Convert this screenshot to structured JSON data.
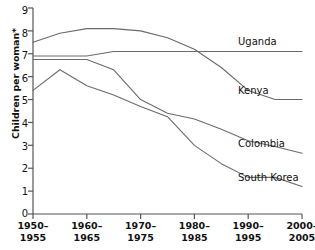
{
  "chart_data": {
    "type": "line",
    "title": "",
    "xlabel": "",
    "ylabel": "Children per woman*",
    "ylim": [
      0,
      9
    ],
    "yticks": [
      0,
      1,
      2,
      3,
      4,
      5,
      6,
      7,
      8,
      9
    ],
    "grid": false,
    "legend_position": "line-end-right",
    "x": [
      "1950-1955",
      "1955-1960",
      "1960-1965",
      "1965-1970",
      "1970-1975",
      "1975-1980",
      "1980-1985",
      "1985-1990",
      "1990-1995",
      "1995-2000",
      "2000-2005"
    ],
    "xtick_labels": [
      {
        "line1": "1950–",
        "line2": "1955"
      },
      {
        "line1": "1960–",
        "line2": "1965"
      },
      {
        "line1": "1970–",
        "line2": "1975"
      },
      {
        "line1": "1980–",
        "line2": "1985"
      },
      {
        "line1": "1990–",
        "line2": "1995"
      },
      {
        "line1": "2000–",
        "line2": "2005"
      }
    ],
    "xtick_indices": [
      0,
      2,
      4,
      6,
      8,
      10
    ],
    "series": [
      {
        "name": "Uganda",
        "values": [
          7.5,
          7.9,
          8.1,
          8.1,
          8.0,
          7.7,
          7.2,
          6.4,
          5.4,
          5.0,
          5.0
        ]
      },
      {
        "name": "Kenya",
        "values": [
          6.9,
          6.9,
          6.9,
          7.1,
          7.1,
          7.1,
          7.1,
          7.1,
          7.1,
          7.1,
          7.1
        ]
      },
      {
        "name": "Colombia",
        "values": [
          6.75,
          6.75,
          6.75,
          6.3,
          5.0,
          4.4,
          4.15,
          3.7,
          3.2,
          2.95,
          2.65
        ]
      },
      {
        "name": "South Korea",
        "values": [
          5.4,
          6.3,
          5.6,
          5.2,
          4.7,
          4.25,
          3.0,
          2.2,
          1.6,
          1.6,
          1.2
        ]
      }
    ],
    "series_label_text": [
      "Uganda",
      "Kenya",
      "Colombia",
      "South Korea"
    ],
    "line_color": "#6b6b6b",
    "axis_color": "#555555",
    "text_color": "#111111"
  }
}
